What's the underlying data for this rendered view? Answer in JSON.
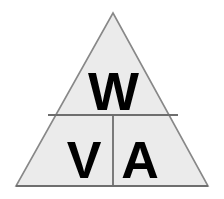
{
  "diagram": {
    "name": "power-triangle",
    "formula": "W = V × A",
    "shape": "triangle",
    "background_color": "#ffffff",
    "fill_color": "#ebebeb",
    "outline_color": "#888888",
    "base_line_color": "#6e6e6e",
    "divider_color": "#6e6e6e",
    "text_color": "#000000",
    "geometry": {
      "apex": [
        113,
        13
      ],
      "bottom_left": [
        16,
        186
      ],
      "bottom_right": [
        208,
        186
      ],
      "horizontal_divider_y": 115,
      "horizontal_divider_x1": 48,
      "horizontal_divider_x2": 178,
      "vertical_divider_x": 113,
      "vertical_divider_y1": 115,
      "vertical_divider_y2": 186
    },
    "cells": {
      "top": {
        "label": "W",
        "meaning": "watts",
        "position": "top",
        "center": [
          113,
          88
        ]
      },
      "bottom_left": {
        "label": "V",
        "meaning": "volts",
        "position": "bottom-left",
        "center": [
          84,
          155
        ]
      },
      "bottom_right": {
        "label": "A",
        "meaning": "amps",
        "position": "bottom-right",
        "center": [
          140,
          155
        ]
      }
    }
  }
}
